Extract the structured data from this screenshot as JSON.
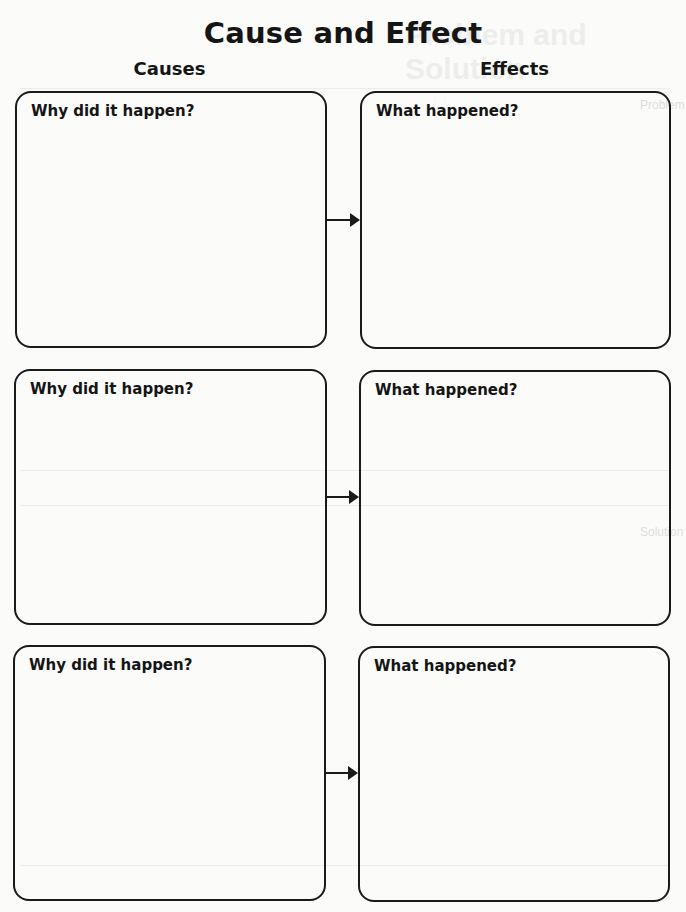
{
  "page": {
    "title": "Cause and Effect",
    "columns": {
      "causes": "Causes",
      "effects": "Effects"
    }
  },
  "ghost_bleedthrough": {
    "title": "Problem and Solution",
    "labels": [
      "Problem",
      "Solution"
    ]
  },
  "rows": [
    {
      "cause_prompt": "Why did it happen?",
      "cause_value": "",
      "effect_prompt": "What happened?",
      "effect_value": ""
    },
    {
      "cause_prompt": "Why did it happen?",
      "cause_value": "",
      "effect_prompt": "What happened?",
      "effect_value": ""
    },
    {
      "cause_prompt": "Why did it happen?",
      "cause_value": "",
      "effect_prompt": "What happened?",
      "effect_value": ""
    }
  ],
  "icons": {
    "arrow": "arrow-right-icon"
  }
}
